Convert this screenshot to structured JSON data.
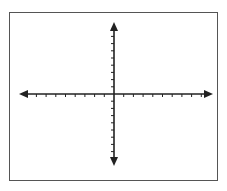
{
  "diagram": {
    "type": "coordinate-plane",
    "colors": {
      "axis": "#222222",
      "frame": "#555555",
      "background": "#ffffff"
    },
    "origin": {
      "x": 114,
      "y": 94
    },
    "x_axis": {
      "x_start": 19,
      "x_end": 213,
      "tick_spacing": 9.7,
      "ticks_left": 9,
      "ticks_right": 9,
      "tick_labels": []
    },
    "y_axis": {
      "y_start": 22,
      "y_end": 166,
      "tick_spacing": 7.2,
      "ticks_up": 9,
      "ticks_down": 8,
      "tick_labels": []
    },
    "arrows": [
      "left",
      "right",
      "up",
      "down"
    ]
  }
}
